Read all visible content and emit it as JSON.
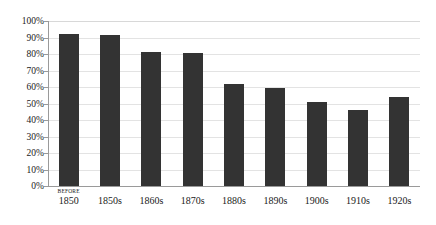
{
  "chart_data": {
    "type": "bar",
    "title": "",
    "subtitle": "",
    "xlabel": "",
    "ylabel": "",
    "categories": [
      "BEFORE 1850",
      "1850s",
      "1860s",
      "1870s",
      "1880s",
      "1890s",
      "1900s",
      "1910s",
      "1920s"
    ],
    "category_prefixes": [
      "BEFORE",
      "",
      "",
      "",
      "",
      "",
      "",
      "",
      ""
    ],
    "category_mains": [
      "1850",
      "1850s",
      "1860s",
      "1870s",
      "1880s",
      "1890s",
      "1900s",
      "1910s",
      "1920s"
    ],
    "values": [
      92,
      91.5,
      81,
      80.5,
      62,
      59.5,
      51,
      46,
      54
    ],
    "value_labels": [
      "92%",
      "91.5%",
      "81%",
      "80.5%",
      "62%",
      "59.5%",
      "51%",
      "46%",
      "54%"
    ],
    "ylim": [
      0,
      100
    ],
    "ytick_values": [
      0,
      10,
      20,
      30,
      40,
      50,
      60,
      70,
      80,
      90,
      100
    ],
    "ytick_labels": [
      "0%",
      "10%",
      "20%",
      "30%",
      "40%",
      "50%",
      "60%",
      "70%",
      "80%",
      "90%",
      "100%"
    ],
    "grid": true,
    "grid_axis": "y",
    "legend": false,
    "legend_position": "none",
    "series": [
      {
        "name": "",
        "values": [
          92,
          91.5,
          81,
          80.5,
          62,
          59.5,
          51,
          46,
          54
        ],
        "color": "#333333"
      }
    ]
  },
  "style": {
    "background_color": "#ffffff",
    "bar_color": "#333333",
    "gridline_color": "#e3e3e3",
    "axis_color": "#9a9a9a",
    "text_color": "#1a1a1a"
  }
}
